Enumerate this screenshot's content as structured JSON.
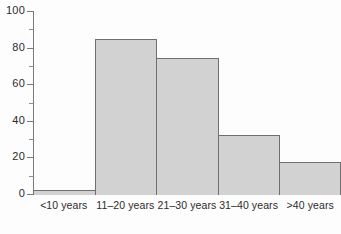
{
  "chart_data": {
    "type": "bar",
    "title": "",
    "subtitle": "",
    "xlabel": "",
    "ylabel": "",
    "categories": [
      "<10 years",
      "11–20 years",
      "21–30 years",
      "31–40 years",
      ">40 years"
    ],
    "values": [
      3,
      85,
      75,
      33,
      18
    ],
    "ylim": [
      0,
      100
    ],
    "y_major_ticks": [
      0,
      20,
      40,
      60,
      80,
      100
    ],
    "y_minor_ticks": [
      10,
      30,
      50,
      70,
      90
    ],
    "y_tick_labels": [
      "0",
      "20",
      "40",
      "60",
      "80",
      "100"
    ],
    "grid": false,
    "legend": null,
    "legend_position": "none",
    "bar_fill_color": "#d2d2d2",
    "bar_edge_color": "#6f6f6f",
    "axis_color": "#7a7a7a",
    "text_color": "#2b2b2b",
    "background_color": "#fdfdfd"
  }
}
